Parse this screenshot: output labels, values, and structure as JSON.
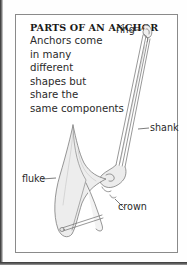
{
  "card": {
    "title": "PARTS OF AN ANCHOR",
    "body_lines": [
      "Anchors come",
      "in many",
      "different",
      "shapes but",
      "share the",
      "same components"
    ]
  },
  "diagram": {
    "labels": {
      "ring": "ring",
      "shank": "shank",
      "fluke": "fluke",
      "crown": "crown"
    }
  },
  "colors": {
    "text": "#2a2a2a",
    "border": "#8a8a8a",
    "line_art": "#6b6b6b",
    "fill_light": "#e9e9e9"
  }
}
